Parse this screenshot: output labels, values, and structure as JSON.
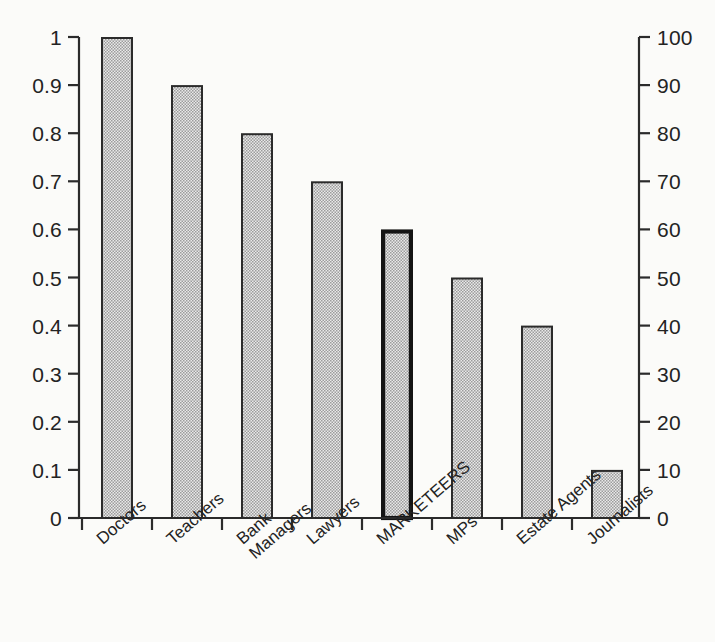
{
  "chart_data": {
    "type": "bar",
    "title": "",
    "subtitle": "",
    "xlabel": "",
    "ylabel": "",
    "categories": [
      "Doctors",
      "Teachers",
      "Bank Managers",
      "Lawyers",
      "MARKETEERS",
      "MPs",
      "Estate Agents",
      "Journalists"
    ],
    "values": [
      1.0,
      0.9,
      0.8,
      0.7,
      0.6,
      0.5,
      0.4,
      0.1
    ],
    "values_right_scale": [
      100,
      90,
      80,
      70,
      60,
      50,
      40,
      10
    ],
    "highlighted_category": "MARKETEERS",
    "ylim": [
      0,
      1
    ],
    "ylim_right": [
      0,
      100
    ],
    "grid": false,
    "legend": "none",
    "axis_left": {
      "min": 0,
      "max": 1,
      "step": 0.1,
      "ticks": [
        "1",
        "0.9",
        "0.8",
        "0.7",
        "0.6",
        "0.5",
        "0.4",
        "0.3",
        "0.2",
        "0.1",
        "0"
      ]
    },
    "axis_right": {
      "min": 0,
      "max": 100,
      "step": 10,
      "ticks": [
        "100",
        "90",
        "80",
        "70",
        "60",
        "50",
        "40",
        "30",
        "20",
        "10",
        "0"
      ]
    },
    "colors": {
      "background": "#fbfbf9",
      "bar_fill": "#b8b8b8",
      "bar_border": "#2b2b2b",
      "highlight_border": "#141414",
      "axis": "#2b2b2b",
      "text": "#232323"
    }
  },
  "labels": {
    "category_lines": [
      [
        "Doctors",
        ""
      ],
      [
        "Teachers",
        ""
      ],
      [
        "Bank",
        "Managers"
      ],
      [
        "Lawyers",
        ""
      ],
      [
        "MARKETEERS",
        ""
      ],
      [
        "MPs",
        ""
      ],
      [
        "Estate Agents",
        ""
      ],
      [
        "Journalists",
        ""
      ]
    ]
  }
}
